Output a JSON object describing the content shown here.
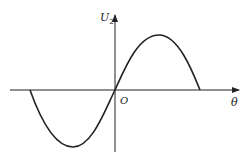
{
  "diagram": {
    "type": "sine-wave-plot",
    "y_axis_label": "U",
    "y_axis_subscript": "2",
    "x_axis_label": "θ",
    "origin_label": "O",
    "curve": "one full period of a sine wave, negative half-cycle left of origin, positive half-cycle right of origin",
    "colors": {
      "stroke": "#222222",
      "background": "#ffffff"
    }
  }
}
